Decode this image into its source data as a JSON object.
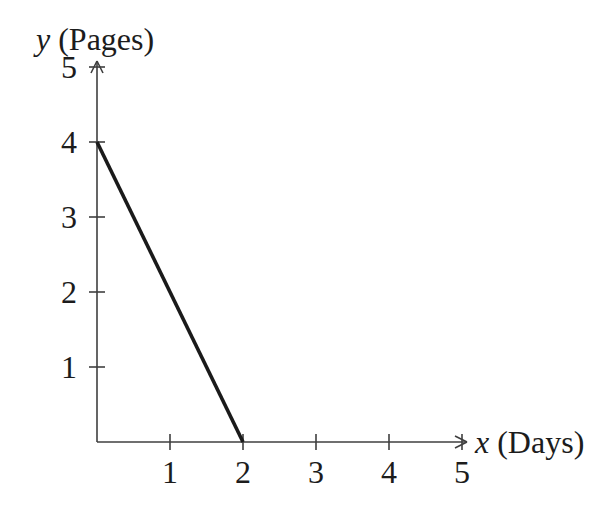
{
  "figure": {
    "background": "#ffffff",
    "axis_color": "#3f3f3f",
    "line_color": "#1a1a1a",
    "text_color": "#1c1c1c"
  },
  "chart_data": {
    "type": "line",
    "xlabel": "x (Days)",
    "ylabel": "y (Pages)",
    "xlim": [
      0,
      5
    ],
    "ylim": [
      0,
      5
    ],
    "x_ticks": [
      1,
      2,
      3,
      4,
      5
    ],
    "y_ticks": [
      1,
      2,
      3,
      4,
      5
    ],
    "grid": false,
    "legend": "none",
    "series": [
      {
        "name": "pages-vs-days-line",
        "points": [
          [
            0,
            4
          ],
          [
            2,
            0
          ]
        ]
      }
    ]
  }
}
